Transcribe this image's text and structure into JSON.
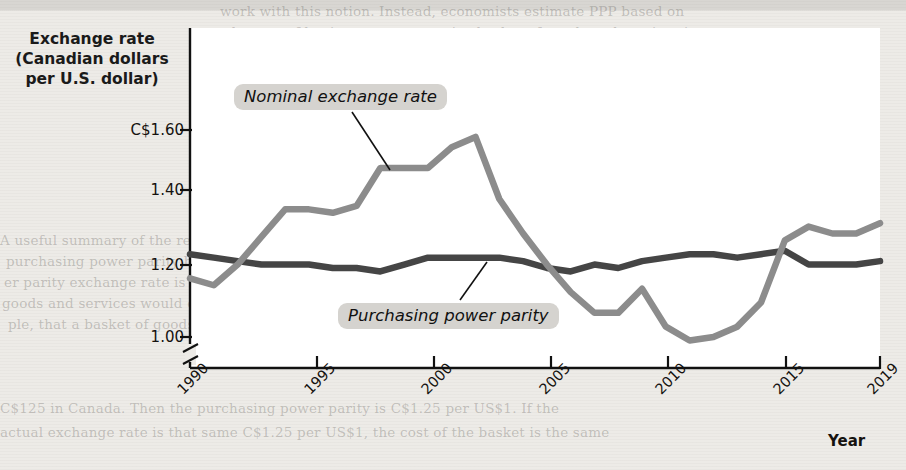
{
  "figure": {
    "y_axis_title": "Exchange rate\n(Canadian dollars\nper U.S. dollar)",
    "x_axis_title": "Year"
  },
  "labels": {
    "nominal": "Nominal exchange rate",
    "ppp": "Purchasing power parity"
  },
  "colors": {
    "nominal_line": "#8c8c8c",
    "ppp_line": "#454545",
    "label_background": "#d5d3cf",
    "panel_background": "#ffffff",
    "page_background": "#edebe7",
    "axis": "#111111"
  },
  "axis": {
    "y_ticks": [
      "C$1.60",
      "1.40",
      "1.20",
      "1.00"
    ],
    "y_tick_values": [
      1.6,
      1.4,
      1.2,
      1.0
    ],
    "y_axis_break": true,
    "x_ticks": [
      "1990",
      "1995",
      "2000",
      "2005",
      "2010",
      "2015",
      "2019"
    ],
    "x_tick_values": [
      1990,
      1995,
      2000,
      2005,
      2010,
      2015,
      2019
    ]
  },
  "chart_data": {
    "type": "line",
    "title": "",
    "xlabel": "Year",
    "ylabel": "Exchange rate (Canadian dollars per U.S. dollar)",
    "xlim": [
      1990,
      2019
    ],
    "ylim": [
      0.93,
      1.66
    ],
    "grid": false,
    "legend": "inline-annotations",
    "x": [
      1990,
      1991,
      1992,
      1993,
      1994,
      1995,
      1996,
      1997,
      1998,
      1999,
      2000,
      2001,
      2002,
      2003,
      2004,
      2005,
      2006,
      2007,
      2008,
      2009,
      2010,
      2011,
      2012,
      2013,
      2014,
      2015,
      2016,
      2017,
      2018,
      2019
    ],
    "series": [
      {
        "name": "Nominal exchange rate",
        "color": "#8c8c8c",
        "values": [
          1.17,
          1.15,
          1.21,
          1.29,
          1.37,
          1.37,
          1.36,
          1.38,
          1.49,
          1.49,
          1.49,
          1.55,
          1.58,
          1.4,
          1.3,
          1.21,
          1.13,
          1.07,
          1.07,
          1.14,
          1.03,
          0.99,
          1.0,
          1.03,
          1.1,
          1.28,
          1.32,
          1.3,
          1.3,
          1.33
        ]
      },
      {
        "name": "Purchasing power parity",
        "color": "#454545",
        "values": [
          1.24,
          1.23,
          1.22,
          1.21,
          1.21,
          1.21,
          1.2,
          1.2,
          1.19,
          1.21,
          1.23,
          1.23,
          1.23,
          1.23,
          1.22,
          1.2,
          1.19,
          1.21,
          1.2,
          1.22,
          1.23,
          1.24,
          1.24,
          1.23,
          1.24,
          1.25,
          1.21,
          1.21,
          1.21,
          1.22
        ]
      }
    ]
  },
  "page_bleed": {
    "top_lines": [
      "work with this notion. Instead, economists estimate PPP based on",
      "the cost of buying a representative basket of goods and services in",
      "different countries. The exchange rate that equalizes this cost is the",
      "PPP rate."
    ],
    "mid_heading": "Purchasing Power Parity",
    "mid_lines": [
      "A useful summary of the relationship between prices and exchange rates is the concept of",
      "purchasing power parity between two countries' currencies. The purchasing pow-",
      "er parity exchange rate is the nominal exchange rate at which a given basket of",
      "goods and services would cost the same amount in each country. Suppose, for exam-",
      "ple, that a basket of goods and services that costs $100 in the United States costs",
      "C$125 in Canada. Then the purchasing power parity is C$1.25 per US$1. If the",
      "actual exchange rate is that same C$1.25 per US$1, the cost of the basket is the same"
    ]
  }
}
